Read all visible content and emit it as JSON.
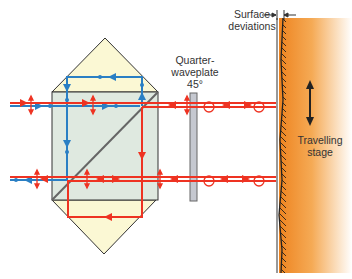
{
  "labels": {
    "surface_deviations_line1": "Surface",
    "surface_deviations_line2": "deviations",
    "quarter_waveplate_line1": "Quarter-",
    "quarter_waveplate_line2": "waveplate",
    "quarter_waveplate_angle": "45°",
    "travelling_stage_line1": "Travelling",
    "travelling_stage_line2": "stage"
  },
  "colors": {
    "beam_red": "#ee3322",
    "beam_blue": "#2a7fc4",
    "prism_cap": "#fbf8d4",
    "cube_fill": "#dfe9e0",
    "waveplate": "#bfc3cc",
    "stage_orange": "#f08c2a",
    "outline": "#333333"
  },
  "components": [
    "polarizing beam splitter cube",
    "upper roof prism",
    "lower roof prism",
    "quarter-waveplate 45°",
    "surface mirror",
    "travelling stage"
  ]
}
